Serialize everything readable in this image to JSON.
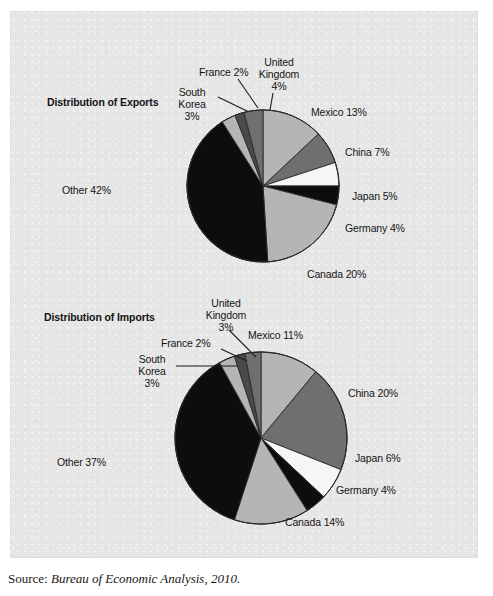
{
  "figure": {
    "source_label": "Source:",
    "source_text": "Bureau of Economic Analysis, 2010.",
    "plate_color": "#e6e6e6"
  },
  "palette": {
    "black": "#0d0d0d",
    "dark_gray": "#4a4a4a",
    "medium_gray": "#6f6f6f",
    "light_gray": "#b5b5b5",
    "white": "#f6f6f6",
    "outline": "#2b2b2b",
    "leader_line": "#1a1a1a"
  },
  "charts": [
    {
      "id": "exports",
      "title": "Distribution of Exports",
      "labels": {
        "mexico": "Mexico 13%",
        "china": "China 7%",
        "japan": "Japan 5%",
        "germany": "Germany 4%",
        "canada": "Canada 20%",
        "other": "Other 42%",
        "korea": "South\nKorea\n3%",
        "france": "France 2%",
        "uk": "United\nKingdom\n4%"
      }
    },
    {
      "id": "imports",
      "title": "Distribution of Imports",
      "labels": {
        "mexico": "Mexico 11%",
        "china": "China 20%",
        "japan": "Japan 6%",
        "germany": "Germany 4%",
        "canada": "Canada 14%",
        "other": "Other 37%",
        "korea": "South\nKorea\n3%",
        "france": "France 2%",
        "uk": "United\nKingdom\n3%"
      }
    }
  ],
  "chart_data": [
    {
      "type": "pie",
      "title": "Distribution of Exports",
      "xlabel": "",
      "ylabel": "",
      "legend": "labels-outside",
      "units": "percent",
      "start_angle_deg": 0,
      "direction": "clockwise",
      "categories": [
        "Mexico",
        "China",
        "Japan",
        "Germany",
        "Canada",
        "Other",
        "South Korea",
        "France",
        "United Kingdom"
      ],
      "values": [
        13,
        7,
        5,
        4,
        20,
        42,
        3,
        2,
        4
      ],
      "slice_colors": [
        "#b5b5b5",
        "#6f6f6f",
        "#f6f6f6",
        "#0d0d0d",
        "#b5b5b5",
        "#0d0d0d",
        "#b5b5b5",
        "#4a4a4a",
        "#6f6f6f"
      ],
      "data_labels": [
        "Mexico 13%",
        "China 7%",
        "Japan 5%",
        "Germany 4%",
        "Canada 20%",
        "Other 42%",
        "South Korea 3%",
        "France 2%",
        "United Kingdom 4%"
      ],
      "center": [
        263,
        186
      ],
      "radius": 76
    },
    {
      "type": "pie",
      "title": "Distribution of Imports",
      "xlabel": "",
      "ylabel": "",
      "legend": "labels-outside",
      "units": "percent",
      "start_angle_deg": 0,
      "direction": "clockwise",
      "categories": [
        "Mexico",
        "China",
        "Japan",
        "Germany",
        "Canada",
        "Other",
        "South Korea",
        "France",
        "United Kingdom"
      ],
      "values": [
        11,
        20,
        6,
        4,
        14,
        37,
        3,
        2,
        3
      ],
      "slice_colors": [
        "#b5b5b5",
        "#6f6f6f",
        "#f6f6f6",
        "#0d0d0d",
        "#b5b5b5",
        "#0d0d0d",
        "#b5b5b5",
        "#4a4a4a",
        "#6f6f6f"
      ],
      "data_labels": [
        "Mexico 11%",
        "China 20%",
        "Japan 6%",
        "Germany 4%",
        "Canada 14%",
        "Other 37%",
        "South Korea 3%",
        "France 2%",
        "United Kingdom 3%"
      ],
      "center": [
        261,
        438
      ],
      "radius": 86
    }
  ]
}
